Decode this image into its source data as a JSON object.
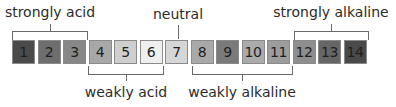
{
  "diagram": {
    "boxes": [
      {
        "value": "1",
        "color": "#4a4a4a"
      },
      {
        "value": "2",
        "color": "#6e6e6e"
      },
      {
        "value": "3",
        "color": "#878787"
      },
      {
        "value": "4",
        "color": "#a8a8a8"
      },
      {
        "value": "5",
        "color": "#cfcfcf"
      },
      {
        "value": "6",
        "color": "#efefef"
      },
      {
        "value": "7",
        "color": "#d6d6d6"
      },
      {
        "value": "8",
        "color": "#a9a9a9"
      },
      {
        "value": "9",
        "color": "#7a7a7a"
      },
      {
        "value": "10",
        "color": "#ababab"
      },
      {
        "value": "11",
        "color": "#9d9d9d"
      },
      {
        "value": "12",
        "color": "#8e8e8e"
      },
      {
        "value": "13",
        "color": "#666666"
      },
      {
        "value": "14",
        "color": "#4a4a4a"
      }
    ],
    "groups": {
      "strongly_acid": {
        "label": "strongly acid",
        "range": "1-3"
      },
      "weakly_acid": {
        "label": "weakly acid",
        "range": "4-6"
      },
      "neutral": {
        "label": "neutral",
        "range": "7"
      },
      "weakly_alkaline": {
        "label": "weakly alkaline",
        "range": "8-11"
      },
      "strongly_alkaline": {
        "label": "strongly alkaline",
        "range": "12-14"
      }
    }
  }
}
